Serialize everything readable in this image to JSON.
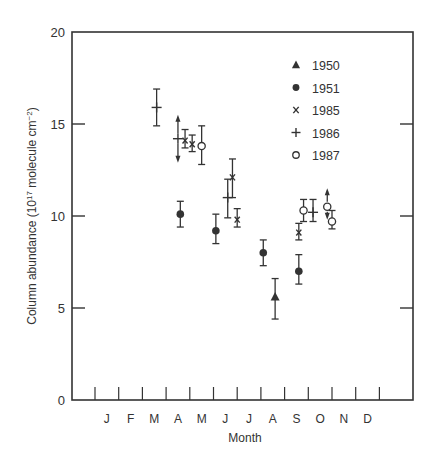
{
  "chart_data": {
    "type": "scatter",
    "title": "",
    "xlabel": "Month",
    "ylabel": "Column abundance (10^17 molecule cm^-2)",
    "ylabel_parts": {
      "main": "Column abundance (10",
      "sup1": "17",
      "mid": " molecule cm",
      "sup2": "−2",
      "end": ")"
    },
    "ylim": [
      0,
      20
    ],
    "yticks": [
      0,
      5,
      10,
      15,
      20
    ],
    "ytick_labels": [
      "0",
      "5",
      "10",
      "15",
      "20"
    ],
    "categories": [
      "J",
      "F",
      "M",
      "A",
      "M",
      "J",
      "J",
      "A",
      "S",
      "O",
      "N",
      "D"
    ],
    "grid": false,
    "legend_position": "upper right (inside)",
    "legend": [
      {
        "name": "1950",
        "marker": "filled-triangle"
      },
      {
        "name": "1951",
        "marker": "filled-circle"
      },
      {
        "name": "1985",
        "marker": "x"
      },
      {
        "name": "1986",
        "marker": "plus"
      },
      {
        "name": "1987",
        "marker": "open-circle"
      }
    ],
    "series": [
      {
        "name": "1950",
        "marker": "filled-triangle",
        "points": [
          {
            "month": 8.1,
            "y": 5.6,
            "ylo": 4.4,
            "yhi": 6.6
          }
        ]
      },
      {
        "name": "1951",
        "marker": "filled-circle",
        "points": [
          {
            "month": 4.1,
            "y": 10.1,
            "ylo": 9.4,
            "yhi": 10.8
          },
          {
            "month": 5.6,
            "y": 9.2,
            "ylo": 8.5,
            "yhi": 10.1
          },
          {
            "month": 7.6,
            "y": 8.0,
            "ylo": 7.3,
            "yhi": 8.7
          },
          {
            "month": 9.1,
            "y": 7.0,
            "ylo": 6.3,
            "yhi": 7.9
          }
        ]
      },
      {
        "name": "1985",
        "marker": "x",
        "points": [
          {
            "month": 4.3,
            "y": 14.1,
            "ylo": 13.7,
            "yhi": 14.7
          },
          {
            "month": 4.6,
            "y": 13.9,
            "ylo": 13.5,
            "yhi": 14.4
          },
          {
            "month": 6.3,
            "y": 12.1,
            "ylo": 11.0,
            "yhi": 13.1
          },
          {
            "month": 6.5,
            "y": 9.8,
            "ylo": 9.4,
            "yhi": 10.4
          },
          {
            "month": 9.1,
            "y": 9.1,
            "ylo": 8.7,
            "yhi": 9.6
          }
        ]
      },
      {
        "name": "1986",
        "marker": "plus",
        "points": [
          {
            "month": 3.1,
            "y": 15.9,
            "ylo": 14.9,
            "yhi": 16.9
          },
          {
            "month": 4.0,
            "y": 14.2,
            "ylo": 13.0,
            "yhi": 15.4,
            "arrows": "both"
          },
          {
            "month": 6.1,
            "y": 11.0,
            "ylo": 9.9,
            "yhi": 12.0
          },
          {
            "month": 9.7,
            "y": 10.2,
            "ylo": 9.7,
            "yhi": 10.9
          }
        ]
      },
      {
        "name": "1987",
        "marker": "open-circle",
        "points": [
          {
            "month": 5.0,
            "y": 13.8,
            "ylo": 12.8,
            "yhi": 14.9
          },
          {
            "month": 9.3,
            "y": 10.3,
            "ylo": 9.7,
            "yhi": 10.9
          },
          {
            "month": 10.3,
            "y": 10.5,
            "ylo": 9.9,
            "yhi": 11.4,
            "arrows": "both"
          },
          {
            "month": 10.5,
            "y": 9.7,
            "ylo": 9.3,
            "yhi": 10.3
          }
        ]
      }
    ]
  }
}
